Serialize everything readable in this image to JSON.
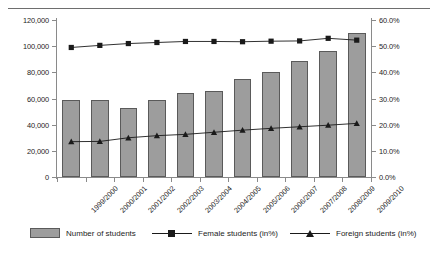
{
  "chart_data": {
    "type": "bar",
    "title": "",
    "subtitle": "",
    "xlabel": "",
    "ylabel": "",
    "grid": false,
    "legend_position": "bottom",
    "categories": [
      "1999/2000",
      "2000/2001",
      "2001/2002",
      "2002/2003",
      "2003/2004",
      "2004/2005",
      "2005/2006",
      "2006/2007",
      "2007/2008",
      "2008/2009",
      "2009/2010"
    ],
    "series": [
      {
        "name": "Number of students",
        "type": "bar",
        "axis": "left",
        "values": [
          59000,
          59000,
          53000,
          59000,
          64000,
          66000,
          75000,
          80000,
          89000,
          96000,
          110000
        ]
      },
      {
        "name": "Female students (in%)",
        "type": "line",
        "axis": "right",
        "marker": "square",
        "values": [
          49.5,
          50.3,
          51.0,
          51.4,
          51.8,
          51.8,
          51.7,
          51.9,
          52.0,
          53.0,
          52.3
        ]
      },
      {
        "name": "Foreign students (in%)",
        "type": "line",
        "axis": "right",
        "marker": "triangle",
        "values": [
          13.5,
          13.6,
          15.0,
          15.8,
          16.3,
          17.1,
          17.9,
          18.6,
          19.2,
          19.8,
          20.5
        ]
      }
    ],
    "ylim": [
      0,
      120000
    ],
    "yticks": [
      0,
      20000,
      40000,
      60000,
      80000,
      100000,
      120000
    ],
    "ytick_labels": [
      "0",
      "20,000",
      "40,000",
      "60,000",
      "80,000",
      "100,000",
      "120,000"
    ],
    "ylim_secondary": [
      0,
      60
    ],
    "yticks_secondary": [
      0,
      10,
      20,
      30,
      40,
      50,
      60
    ],
    "ytick_labels_secondary": [
      "0.0%",
      "10.0%",
      "20.0%",
      "30.0%",
      "40.0%",
      "50.0%",
      "60.0%"
    ],
    "colors": {
      "bar_fill": "#9d9d9d",
      "bar_border": "#5a5a5a",
      "line": "#1a1a1a",
      "axis": "#8a8a8a",
      "text": "#1d1d1d"
    }
  },
  "legend": {
    "items": [
      {
        "label": "Number of students",
        "marker": "swatch"
      },
      {
        "label": "Female students (in%)",
        "marker": "line-square"
      },
      {
        "label": "Foreign students (in%)",
        "marker": "line-triangle"
      }
    ]
  }
}
